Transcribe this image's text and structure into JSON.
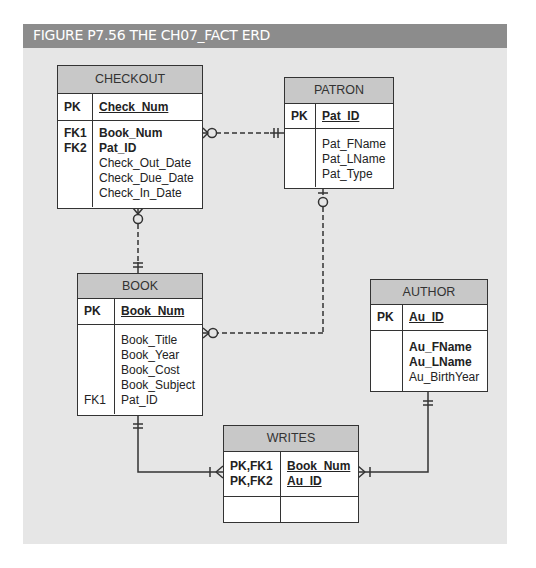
{
  "figure": {
    "title": "FIGURE P7.56  THE CH07_FACT ERD",
    "colors": {
      "title_bar": "#8c8c8c",
      "panel": "#e6e6e6",
      "entity_header": "#c8c8c8",
      "line": "#333333"
    }
  },
  "entities": {
    "checkout": {
      "name": "CHECKOUT",
      "pk": {
        "key": "PK",
        "attr": "Check_Num"
      },
      "attributes": [
        {
          "key": "FK1",
          "name": "Book_Num",
          "bold": true
        },
        {
          "key": "FK2",
          "name": "Pat_ID",
          "bold": true
        },
        {
          "key": "",
          "name": "Check_Out_Date",
          "bold": false
        },
        {
          "key": "",
          "name": "Check_Due_Date",
          "bold": false
        },
        {
          "key": "",
          "name": "Check_In_Date",
          "bold": false
        }
      ]
    },
    "patron": {
      "name": "PATRON",
      "pk": {
        "key": "PK",
        "attr": "Pat_ID"
      },
      "attributes": [
        {
          "key": "",
          "name": "Pat_FName",
          "bold": false
        },
        {
          "key": "",
          "name": "Pat_LName",
          "bold": false
        },
        {
          "key": "",
          "name": "Pat_Type",
          "bold": false
        }
      ]
    },
    "book": {
      "name": "BOOK",
      "pk": {
        "key": "PK",
        "attr": "Book_Num"
      },
      "attributes": [
        {
          "key": "",
          "name": "Book_Title",
          "bold": false
        },
        {
          "key": "",
          "name": "Book_Year",
          "bold": false
        },
        {
          "key": "",
          "name": "Book_Cost",
          "bold": false
        },
        {
          "key": "",
          "name": "Book_Subject",
          "bold": false
        },
        {
          "key": "FK1",
          "name": "Pat_ID",
          "bold": false
        }
      ]
    },
    "author": {
      "name": "AUTHOR",
      "pk": {
        "key": "PK",
        "attr": "Au_ID"
      },
      "attributes": [
        {
          "key": "",
          "name": "Au_FName",
          "bold": true
        },
        {
          "key": "",
          "name": "Au_LName",
          "bold": true
        },
        {
          "key": "",
          "name": "Au_BirthYear",
          "bold": false
        }
      ]
    },
    "writes": {
      "name": "WRITES",
      "pk_keys": [
        "PK,FK1",
        "PK,FK2"
      ],
      "pk_attrs": [
        "Book_Num",
        "Au_ID"
      ]
    }
  },
  "relationships": [
    {
      "from": "PATRON",
      "to": "CHECKOUT",
      "from_cardinality": "one-and-only-one",
      "to_cardinality": "zero-or-many",
      "style": "dashed"
    },
    {
      "from": "BOOK",
      "to": "CHECKOUT",
      "from_cardinality": "one-and-only-one",
      "to_cardinality": "zero-or-many",
      "style": "dashed"
    },
    {
      "from": "PATRON",
      "to": "BOOK",
      "from_cardinality": "zero-or-one",
      "to_cardinality": "zero-or-many",
      "style": "dashed"
    },
    {
      "from": "BOOK",
      "to": "WRITES",
      "from_cardinality": "one-and-only-one",
      "to_cardinality": "one-or-many",
      "style": "solid"
    },
    {
      "from": "AUTHOR",
      "to": "WRITES",
      "from_cardinality": "one-and-only-one",
      "to_cardinality": "one-or-many",
      "style": "solid"
    }
  ]
}
